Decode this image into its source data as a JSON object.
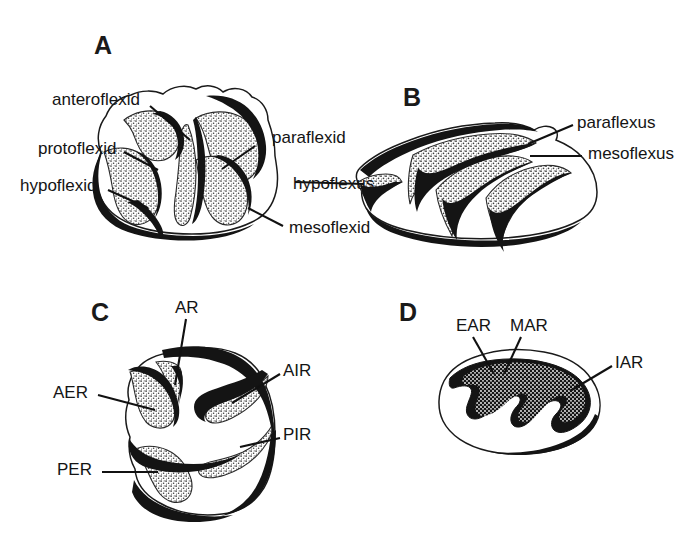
{
  "figure": {
    "background_color": "#ffffff",
    "ink_color": "#1a1a1a",
    "stipple_color": "#8a8a8a"
  },
  "panels": [
    {
      "id": "A",
      "letter": "A",
      "name": "lower-molar-occlusal",
      "labels": [
        {
          "key": "anteroflexid",
          "text": "anteroflexid",
          "side": "left"
        },
        {
          "key": "protoflexid",
          "text": "protoflexid",
          "side": "left"
        },
        {
          "key": "hypoflexid",
          "text": "hypoflexid",
          "side": "left"
        },
        {
          "key": "paraflexid",
          "text": "paraflexid",
          "side": "right"
        },
        {
          "key": "mesoflexid",
          "text": "mesoflexid",
          "side": "right"
        }
      ]
    },
    {
      "id": "B",
      "letter": "B",
      "name": "upper-molar-occlusal",
      "labels": [
        {
          "key": "paraflexus",
          "text": "paraflexus",
          "side": "right"
        },
        {
          "key": "mesoflexus",
          "text": "mesoflexus",
          "side": "right"
        },
        {
          "key": "hypoflexus",
          "text": "hypoflexus",
          "side": "left"
        }
      ]
    },
    {
      "id": "C",
      "letter": "C",
      "name": "lower-tooth-reentrants",
      "labels": [
        {
          "key": "AR",
          "text": "AR",
          "side": "top"
        },
        {
          "key": "AIR",
          "text": "AIR",
          "side": "right"
        },
        {
          "key": "PIR",
          "text": "PIR",
          "side": "right"
        },
        {
          "key": "AER",
          "text": "AER",
          "side": "left"
        },
        {
          "key": "PER",
          "text": "PER",
          "side": "left"
        }
      ]
    },
    {
      "id": "D",
      "letter": "D",
      "name": "upper-tooth-reentrants",
      "labels": [
        {
          "key": "EAR",
          "text": "EAR",
          "side": "top"
        },
        {
          "key": "MAR",
          "text": "MAR",
          "side": "top"
        },
        {
          "key": "IAR",
          "text": "IAR",
          "side": "right"
        }
      ]
    }
  ]
}
